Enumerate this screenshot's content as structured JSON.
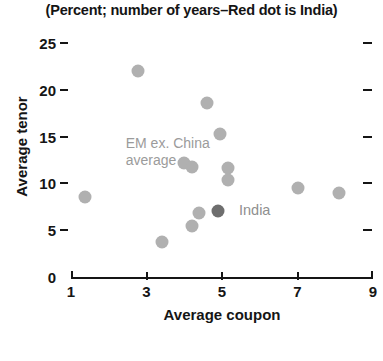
{
  "chart_data": {
    "type": "scatter",
    "title": "(Percent; number of years–Red dot is India)",
    "xlabel": "Average coupon",
    "ylabel": "Average tenor",
    "xlim": [
      1,
      9
    ],
    "ylim": [
      0,
      25
    ],
    "xticks": [
      1,
      3,
      5,
      7,
      9
    ],
    "yticks": [
      0,
      5,
      10,
      15,
      20,
      25
    ],
    "grid": false,
    "legend": "none",
    "series": [
      {
        "name": "EM ex. China",
        "color": "#b0b0b0",
        "points": [
          {
            "x": 1.37,
            "y": 8.6
          },
          {
            "x": 2.78,
            "y": 22.0
          },
          {
            "x": 4.6,
            "y": 18.6
          },
          {
            "x": 4.95,
            "y": 15.3
          },
          {
            "x": 4.0,
            "y": 12.2
          },
          {
            "x": 4.2,
            "y": 11.8
          },
          {
            "x": 5.15,
            "y": 11.6
          },
          {
            "x": 5.15,
            "y": 10.4
          },
          {
            "x": 4.4,
            "y": 6.8
          },
          {
            "x": 4.2,
            "y": 5.5
          },
          {
            "x": 3.4,
            "y": 3.7
          },
          {
            "x": 7.0,
            "y": 9.5
          },
          {
            "x": 8.1,
            "y": 9.0
          }
        ]
      },
      {
        "name": "India",
        "color": "#6e6e6e",
        "points": [
          {
            "x": 4.9,
            "y": 7.0
          }
        ]
      }
    ],
    "annotations": [
      {
        "name": "em-ex-china-average",
        "text": "EM ex. China\naverage",
        "x": 2.45,
        "y": 14.2
      },
      {
        "name": "india",
        "text": "India",
        "x": 5.45,
        "y": 7.1
      }
    ],
    "colors": {
      "dot": "#b0b0b0",
      "india_dot": "#6e6e6e",
      "annotation": "#9b9b9b",
      "axis": "#151515",
      "title": "#141414",
      "background": "#ffffff"
    }
  }
}
